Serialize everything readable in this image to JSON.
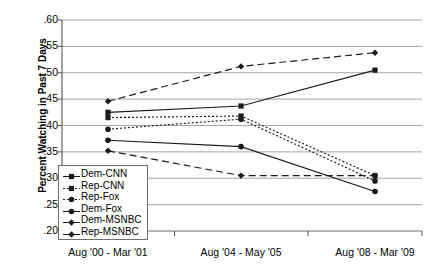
{
  "chart_data": {
    "type": "line",
    "title": "",
    "xlabel": "",
    "ylabel": "Percent Watching in Past 7 Days",
    "categories": [
      "Aug '00 - Mar '01",
      "Aug '04 - May '05",
      "Aug '08 - Mar '09"
    ],
    "ylim": [
      0.2,
      0.6
    ],
    "ytick_labels": [
      ".60",
      ".55",
      ".50",
      ".45",
      ".40",
      ".35",
      ".30",
      ".25",
      ".20"
    ],
    "ytick_values": [
      0.6,
      0.55,
      0.5,
      0.45,
      0.4,
      0.35,
      0.3,
      0.25,
      0.2
    ],
    "grid": true,
    "legend_position": "lower-left-inside",
    "series": [
      {
        "name": "Dem-CNN",
        "values": [
          0.425,
          0.437,
          0.505
        ],
        "style": "solid",
        "marker": "square"
      },
      {
        "name": "Rep-CNN",
        "values": [
          0.415,
          0.418,
          0.305
        ],
        "style": "dotted",
        "marker": "square"
      },
      {
        "name": "Rep-Fox",
        "values": [
          0.393,
          0.412,
          0.295
        ],
        "style": "dotted",
        "marker": "circle"
      },
      {
        "name": "Dem-Fox",
        "values": [
          0.372,
          0.36,
          0.275
        ],
        "style": "solid",
        "marker": "circle"
      },
      {
        "name": "Dem-MSNBC",
        "values": [
          0.446,
          0.512,
          0.538
        ],
        "style": "dashed",
        "marker": "diamond"
      },
      {
        "name": "Rep-MSNBC",
        "values": [
          0.352,
          0.305,
          0.305
        ],
        "style": "dashed",
        "marker": "diamond"
      }
    ]
  },
  "legend": {
    "items": [
      "Dem-CNN",
      "Rep-CNN",
      "Rep-Fox",
      "Dem-Fox",
      "Dem-MSNBC",
      "Rep-MSNBC"
    ]
  },
  "axes": {
    "y_title": "Percent Watching in Past 7 Days",
    "y_ticks": [
      ".60",
      ".55",
      ".50",
      ".45",
      ".40",
      ".35",
      ".30",
      ".25",
      ".20"
    ],
    "x_ticks": [
      "Aug '00 - Mar '01",
      "Aug '04 - May '05",
      "Aug '08 - Mar '09"
    ]
  }
}
